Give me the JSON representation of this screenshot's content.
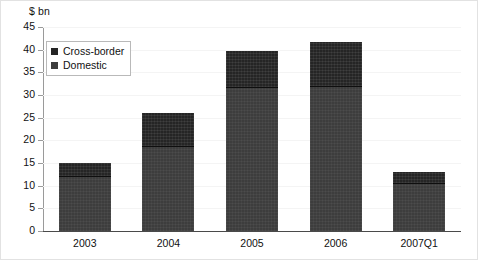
{
  "chart_data": {
    "type": "bar",
    "stacked": true,
    "title": "",
    "subtitle": "",
    "xlabel": "",
    "ylabel": "$ bn",
    "ylim": [
      0,
      45
    ],
    "ytick_step": 5,
    "ytick_labels": [
      "45",
      "40",
      "35",
      "30",
      "25",
      "20",
      "15",
      "10",
      "5",
      "0"
    ],
    "ytick_values": [
      45,
      40,
      35,
      30,
      25,
      20,
      15,
      10,
      5,
      0
    ],
    "grid": true,
    "legend_position": "top-left",
    "categories": [
      "2003",
      "2004",
      "2005",
      "2006",
      "2007Q1"
    ],
    "series": [
      {
        "name": "Cross-border",
        "color": "#252525",
        "values": [
          3.0,
          7.5,
          8.3,
          10.0,
          2.7
        ]
      },
      {
        "name": "Domestic",
        "color": "#3d3d3d",
        "values": [
          12.0,
          18.5,
          31.5,
          31.8,
          10.3
        ]
      }
    ],
    "totals": [
      15.0,
      26.0,
      39.8,
      41.8,
      13.0
    ]
  },
  "legend": {
    "entries": [
      {
        "label": "Cross-border"
      },
      {
        "label": "Domestic"
      }
    ]
  },
  "axis": {
    "y_title": "$ bn"
  }
}
